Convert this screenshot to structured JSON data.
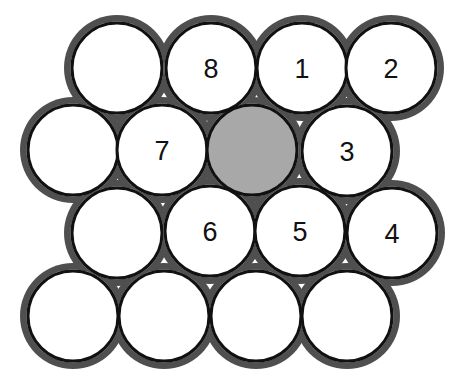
{
  "figure": {
    "canvas": {
      "width": 455,
      "height": 375
    },
    "colors": {
      "page_background": "#ffffff",
      "circle_fill": "#ffffff",
      "circle_stroke": "#111111",
      "center_circle_fill": "#a8a8a8",
      "interstitial_background": "#4f4f4f",
      "label_color": "#111111"
    },
    "geometry": {
      "radius": 45,
      "stroke_width": 3,
      "row_spacing": 82,
      "column_spacing": 90
    }
  },
  "chart_data": {
    "type": "scatter",
    "xlabel": "",
    "ylabel": "",
    "grid": false,
    "legend": null,
    "rows": [
      {
        "row": 1,
        "y": 68,
        "circles": [
          {
            "id": "r1c1",
            "x": 117,
            "y": 68,
            "r": 45,
            "label": "",
            "fill": "#ffffff",
            "role": "plain"
          },
          {
            "id": "r1c2",
            "x": 211,
            "y": 68,
            "r": 45,
            "label": "8",
            "fill": "#ffffff",
            "role": "neighbor"
          },
          {
            "id": "r1c3",
            "x": 302,
            "y": 68,
            "r": 45,
            "label": "1",
            "fill": "#ffffff",
            "role": "neighbor"
          },
          {
            "id": "r1c4",
            "x": 391,
            "y": 68,
            "r": 45,
            "label": "2",
            "fill": "#ffffff",
            "role": "neighbor"
          }
        ]
      },
      {
        "row": 2,
        "y": 150,
        "circles": [
          {
            "id": "r2c1",
            "x": 73,
            "y": 150,
            "r": 45,
            "label": "",
            "fill": "#ffffff",
            "role": "plain"
          },
          {
            "id": "r2c2",
            "x": 162,
            "y": 150,
            "r": 45,
            "label": "7",
            "fill": "#ffffff",
            "role": "neighbor"
          },
          {
            "id": "r2c3",
            "x": 252,
            "y": 150,
            "r": 45,
            "label": "",
            "fill": "#a8a8a8",
            "role": "center"
          },
          {
            "id": "r2c4",
            "x": 347,
            "y": 151,
            "r": 45,
            "label": "3",
            "fill": "#ffffff",
            "role": "neighbor"
          }
        ]
      },
      {
        "row": 3,
        "y": 233,
        "circles": [
          {
            "id": "r3c1",
            "x": 117,
            "y": 233,
            "r": 45,
            "label": "",
            "fill": "#ffffff",
            "role": "plain"
          },
          {
            "id": "r3c2",
            "x": 210,
            "y": 231,
            "r": 45,
            "label": "6",
            "fill": "#ffffff",
            "role": "neighbor"
          },
          {
            "id": "r3c3",
            "x": 300,
            "y": 231,
            "r": 45,
            "label": "5",
            "fill": "#ffffff",
            "role": "neighbor"
          },
          {
            "id": "r3c4",
            "x": 392,
            "y": 233,
            "r": 45,
            "label": "4",
            "fill": "#ffffff",
            "role": "neighbor"
          }
        ]
      },
      {
        "row": 4,
        "y": 316,
        "circles": [
          {
            "id": "r4c1",
            "x": 73,
            "y": 316,
            "r": 45,
            "label": "",
            "fill": "#ffffff",
            "role": "plain"
          },
          {
            "id": "r4c2",
            "x": 164,
            "y": 316,
            "r": 45,
            "label": "",
            "fill": "#ffffff",
            "role": "plain"
          },
          {
            "id": "r4c3",
            "x": 256,
            "y": 316,
            "r": 45,
            "label": "",
            "fill": "#ffffff",
            "role": "plain"
          },
          {
            "id": "r4c4",
            "x": 347,
            "y": 316,
            "r": 45,
            "label": "",
            "fill": "#ffffff",
            "role": "plain"
          }
        ]
      }
    ],
    "labels": [
      "1",
      "2",
      "3",
      "4",
      "5",
      "6",
      "7",
      "8"
    ],
    "label_count": 8,
    "total_circles": 16
  }
}
